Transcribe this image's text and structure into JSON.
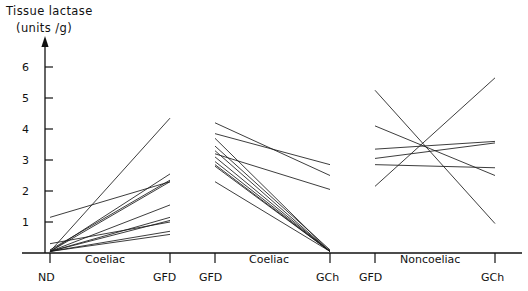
{
  "chart_data": {
    "type": "line",
    "title": "",
    "ylabel": "Tissue lactase (units /g)",
    "ylabel_line1": "Tissue lactase",
    "ylabel_line2": "(units /g)",
    "xlabel": "",
    "ylim": [
      0,
      6.6
    ],
    "yticks": [
      1,
      2,
      3,
      4,
      5,
      6
    ],
    "ytick_labels": [
      "1",
      "2",
      "3",
      "4",
      "5",
      "6"
    ],
    "grid": false,
    "legend": "none",
    "panels": [
      {
        "name": "Coeliac",
        "group_label": "Coeliac",
        "x_categories": [
          "ND",
          "GFD"
        ],
        "series": [
          {
            "name": "subject-1",
            "values": [
              0.05,
              4.35
            ]
          },
          {
            "name": "subject-2",
            "values": [
              0.05,
              2.55
            ]
          },
          {
            "name": "subject-3",
            "values": [
              0.1,
              2.35
            ]
          },
          {
            "name": "subject-4",
            "values": [
              1.15,
              2.3
            ]
          },
          {
            "name": "subject-5",
            "values": [
              0.05,
              2.3
            ]
          },
          {
            "name": "subject-6",
            "values": [
              0.05,
              1.55
            ]
          },
          {
            "name": "subject-7",
            "values": [
              0.05,
              1.15
            ]
          },
          {
            "name": "subject-8",
            "values": [
              0.05,
              1.05
            ]
          },
          {
            "name": "subject-9",
            "values": [
              0.3,
              1.0
            ]
          },
          {
            "name": "subject-10",
            "values": [
              0.05,
              0.7
            ]
          },
          {
            "name": "subject-11",
            "values": [
              0.05,
              0.6
            ]
          }
        ]
      },
      {
        "name": "Coeliac-challenge",
        "group_label": "Coeliac",
        "x_categories": [
          "GFD",
          "GCh"
        ],
        "series": [
          {
            "name": "subject-1",
            "values": [
              4.2,
              2.5
            ]
          },
          {
            "name": "subject-2",
            "values": [
              3.85,
              2.85
            ]
          },
          {
            "name": "subject-3",
            "values": [
              3.7,
              0.05
            ]
          },
          {
            "name": "subject-4",
            "values": [
              3.45,
              0.1
            ]
          },
          {
            "name": "subject-5",
            "values": [
              3.3,
              0.05
            ]
          },
          {
            "name": "subject-6",
            "values": [
              3.2,
              2.05
            ]
          },
          {
            "name": "subject-7",
            "values": [
              3.1,
              0.05
            ]
          },
          {
            "name": "subject-8",
            "values": [
              2.95,
              0.05
            ]
          },
          {
            "name": "subject-9",
            "values": [
              2.85,
              0.05
            ]
          },
          {
            "name": "subject-10",
            "values": [
              2.8,
              0.05
            ]
          },
          {
            "name": "subject-11",
            "values": [
              2.3,
              0.05
            ]
          }
        ]
      },
      {
        "name": "Noncoeliac",
        "group_label": "Noncoeliac",
        "x_categories": [
          "GFD",
          "GCh"
        ],
        "series": [
          {
            "name": "subject-1",
            "values": [
              5.25,
              0.95
            ]
          },
          {
            "name": "subject-2",
            "values": [
              4.1,
              2.5
            ]
          },
          {
            "name": "subject-3",
            "values": [
              3.35,
              3.6
            ]
          },
          {
            "name": "subject-4",
            "values": [
              3.05,
              3.55
            ]
          },
          {
            "name": "subject-5",
            "values": [
              2.85,
              2.75
            ]
          },
          {
            "name": "subject-6",
            "values": [
              2.15,
              5.65
            ]
          }
        ]
      }
    ],
    "x_tick_positions": [
      "ND",
      "GFD",
      "GFD",
      "GCh",
      "GFD",
      "GCh"
    ]
  },
  "axis": {
    "y_title_line1": "Tissue lactase",
    "y_title_line2": "(units /g)",
    "y_ticks": [
      "6",
      "5",
      "4",
      "3",
      "2",
      "1"
    ],
    "x_ticks": [
      {
        "label": "ND"
      },
      {
        "label": "GFD"
      },
      {
        "label": "GFD"
      },
      {
        "label": "GCh"
      },
      {
        "label": "GFD"
      },
      {
        "label": "GCh"
      }
    ],
    "group_labels": [
      "Coeliac",
      "Coeliac",
      "Noncoeliac"
    ]
  },
  "style": {
    "line_color": "#1a1a1a",
    "axis_color": "#111111",
    "background": "#ffffff"
  }
}
